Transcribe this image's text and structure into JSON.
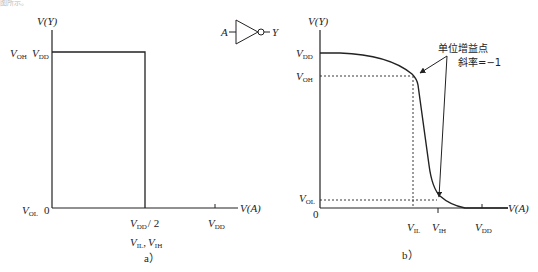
{
  "page": {
    "top_fragment": "图所示。"
  },
  "gate": {
    "input_label": "A",
    "output_label": "Y",
    "type": "inverter"
  },
  "panel_a": {
    "caption": "a）",
    "y_axis_label": "V(Y)",
    "x_axis_label": "V(A)",
    "y_labels": {
      "voh": {
        "main": "V",
        "sub": "OH"
      },
      "vdd": {
        "main": "V",
        "sub": "DD"
      },
      "vol": {
        "main": "V",
        "sub": "OL"
      }
    },
    "origin": "0",
    "x_ticks": {
      "mid": {
        "main": "V",
        "sub": "DD",
        "suffix": "/ 2"
      },
      "mid_sub1": {
        "main": "V",
        "sub": "IL",
        "sep": ","
      },
      "mid_sub2": {
        "main": "V",
        "sub": "IH"
      },
      "vdd": {
        "main": "V",
        "sub": "DD"
      }
    }
  },
  "panel_b": {
    "caption": "b）",
    "y_axis_label": "V(Y)",
    "x_axis_label": "V(A)",
    "y_labels": {
      "vdd": {
        "main": "V",
        "sub": "DD"
      },
      "voh": {
        "main": "V",
        "sub": "OH"
      },
      "vol": {
        "main": "V",
        "sub": "OL"
      }
    },
    "origin": "0",
    "x_ticks": {
      "vil": {
        "main": "V",
        "sub": "IL"
      },
      "vih": {
        "main": "V",
        "sub": "IH"
      },
      "vdd": {
        "main": "V",
        "sub": "DD"
      }
    },
    "annotation": {
      "line1": "单位增益点",
      "line2": "斜率=−1"
    }
  }
}
